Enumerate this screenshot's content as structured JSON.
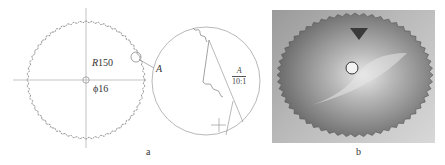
{
  "figure": {
    "panel_a": {
      "caption": "a",
      "radius_label": "R150",
      "radius_prefix": "R",
      "radius_value": "150",
      "bore_label": "ϕ16",
      "detail_marker": "A",
      "detail_view": {
        "label_top": "A",
        "scale": "10:1"
      }
    },
    "panel_b": {
      "caption": "b",
      "content": "photo of toothed circular saw blade"
    },
    "colors": {
      "line": "#8a8a8a",
      "teeth": "#7a7a7a",
      "text": "#333333",
      "photo_blade": "#6e6e6e",
      "photo_bg": "#c4c4c4"
    }
  }
}
